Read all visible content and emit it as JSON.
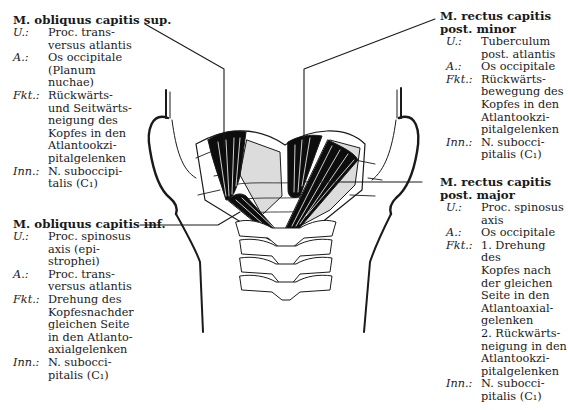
{
  "figure": {
    "muscles": [
      {
        "id": "obliquus-sup",
        "title": [
          "M. obliquus capitis sup."
        ],
        "entries": [
          {
            "key": "U.:",
            "value": "Proc. trans-\nversus atlantis"
          },
          {
            "key": "A.:",
            "value": "Os occipitale\n(Planum\nnuchae)"
          },
          {
            "key": "Fkt.:",
            "value": "Rückwärts-\nund Seitwärts-\nneigung des\nKopfes in den\nAtlantookzi-\npitalgelenken"
          },
          {
            "key": "Inn.:",
            "value": "N. suboccipi-\ntalis (C₁)"
          }
        ]
      },
      {
        "id": "rectus-minor",
        "title": [
          "M. rectus capitis",
          "post. minor"
        ],
        "entries": [
          {
            "key": "U.:",
            "value": "Tuberculum\npost. atlantis"
          },
          {
            "key": "A.:",
            "value": "Os occipitale"
          },
          {
            "key": "Fkt.:",
            "value": "Rückwärts-\nbewegung des\nKopfes in den\nAtlantookzi-\npitalgelenken"
          },
          {
            "key": "Inn.:",
            "value": "N. subocci-\npitalis (C₁)"
          }
        ]
      },
      {
        "id": "obliquus-inf",
        "title": [
          "M. obliquus capitis inf."
        ],
        "entries": [
          {
            "key": "U.:",
            "value": "Proc. spinosus\naxis (epi-\nstrophei)"
          },
          {
            "key": "A.:",
            "value": "Proc. trans-\nversus atlantis"
          },
          {
            "key": "Fkt.:",
            "value": "Drehung des\nKopfesnachder\ngleichen Seite\nin den Atlanto-\naxialgelenken"
          },
          {
            "key": "Inn.:",
            "value": "N. subocci-\npitalis (C₁)"
          }
        ]
      },
      {
        "id": "rectus-major",
        "title": [
          "M. rectus capitis",
          "post. major"
        ],
        "entries": [
          {
            "key": "U.:",
            "value": "Proc. spinosus\naxis"
          },
          {
            "key": "A.:",
            "value": "Os occipitale"
          },
          {
            "key": "Fkt.:",
            "value": "1. Drehung des\nKopfes nach\nder gleichen\nSeite in den\nAtlantoaxial-\ngelenken\n2. Rückwärts-\nneigung in den\nAtlantookzi-\npitalgelenken"
          },
          {
            "key": "Inn.:",
            "value": "N. subocci-\npitalis (C₁)"
          }
        ]
      }
    ],
    "colors": {
      "ink": "#1a1a1a",
      "muscle": "#0d0d0d",
      "shading": "#dcdcdc",
      "background": "#ffffff"
    }
  }
}
